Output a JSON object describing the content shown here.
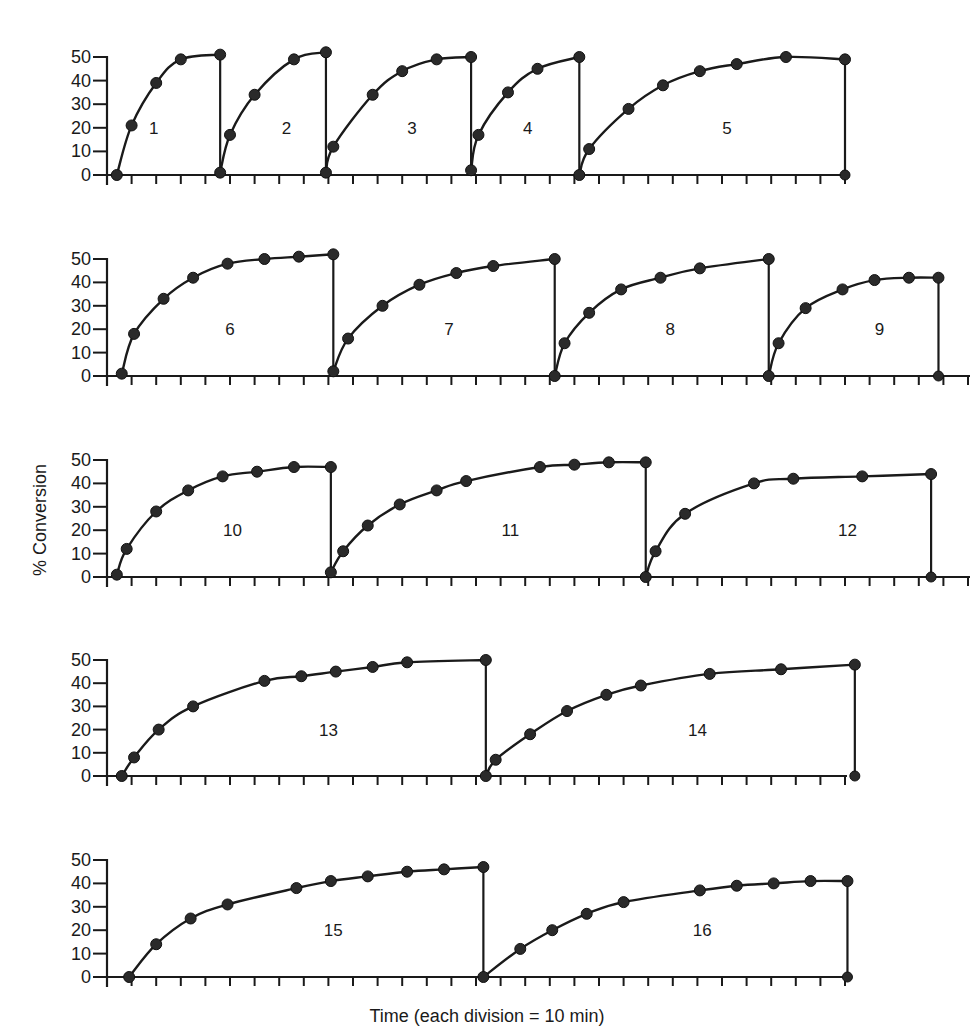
{
  "chart_data": {
    "type": "line",
    "title": "",
    "xlabel": "Time (each division = 10 min)",
    "ylabel": "% Conversion",
    "ylim": [
      0,
      50
    ],
    "yticks": [
      0,
      10,
      20,
      30,
      40,
      50
    ],
    "x_unit": "division (10 min)",
    "grid": false,
    "legend": null,
    "panels": [
      {
        "row": 1,
        "y0_px": 175,
        "y50_px": 57,
        "axis_x_px": 107,
        "tick_px": 24.6,
        "n_ticks": 30,
        "runs": [
          {
            "name": "1",
            "label_x": 1.9,
            "points": [
              [
                0.4,
                0
              ],
              [
                1.0,
                21
              ],
              [
                2.0,
                39
              ],
              [
                3.0,
                49
              ],
              [
                4.6,
                51
              ]
            ],
            "end_x": 4.6,
            "end_drop": true
          },
          {
            "name": "2",
            "label_x": 7.3,
            "points": [
              [
                4.6,
                1
              ],
              [
                5.0,
                17
              ],
              [
                6.0,
                34
              ],
              [
                7.6,
                49
              ],
              [
                8.9,
                52
              ]
            ],
            "end_x": 8.9,
            "end_drop": true
          },
          {
            "name": "3",
            "label_x": 12.4,
            "points": [
              [
                8.9,
                1
              ],
              [
                9.2,
                12
              ],
              [
                10.8,
                34
              ],
              [
                12.0,
                44
              ],
              [
                13.4,
                49
              ],
              [
                14.8,
                50
              ]
            ],
            "end_x": 14.8,
            "end_drop": true
          },
          {
            "name": "4",
            "label_x": 17.1,
            "points": [
              [
                14.8,
                2
              ],
              [
                15.1,
                17
              ],
              [
                16.3,
                35
              ],
              [
                17.5,
                45
              ],
              [
                19.2,
                50
              ]
            ],
            "end_x": 19.2,
            "end_drop": true
          },
          {
            "name": "5",
            "label_x": 25.2,
            "points": [
              [
                19.2,
                0
              ],
              [
                19.6,
                11
              ],
              [
                21.2,
                28
              ],
              [
                22.6,
                38
              ],
              [
                24.1,
                44
              ],
              [
                25.6,
                47
              ],
              [
                27.6,
                50
              ],
              [
                30.0,
                49
              ]
            ],
            "end_x": 30.0,
            "end_drop": true,
            "end_bottom_dot": true
          }
        ]
      },
      {
        "row": 2,
        "y0_px": 376,
        "y50_px": 259,
        "axis_x_px": 107,
        "tick_px": 24.6,
        "n_ticks": 35,
        "runs": [
          {
            "name": "6",
            "label_x": 5.0,
            "points": [
              [
                0.6,
                1
              ],
              [
                1.1,
                18
              ],
              [
                2.3,
                33
              ],
              [
                3.5,
                42
              ],
              [
                4.9,
                48
              ],
              [
                6.4,
                50
              ],
              [
                7.8,
                51
              ],
              [
                9.2,
                52
              ]
            ],
            "end_x": 9.2,
            "end_drop": true
          },
          {
            "name": "7",
            "label_x": 13.9,
            "points": [
              [
                9.2,
                2
              ],
              [
                9.8,
                16
              ],
              [
                11.2,
                30
              ],
              [
                12.7,
                39
              ],
              [
                14.2,
                44
              ],
              [
                15.7,
                47
              ],
              [
                18.2,
                50
              ]
            ],
            "end_x": 18.2,
            "end_drop": true
          },
          {
            "name": "8",
            "label_x": 22.9,
            "points": [
              [
                18.2,
                0
              ],
              [
                18.6,
                14
              ],
              [
                19.6,
                27
              ],
              [
                20.9,
                37
              ],
              [
                22.5,
                42
              ],
              [
                24.1,
                46
              ],
              [
                26.9,
                50
              ]
            ],
            "end_x": 26.9,
            "end_drop": true
          },
          {
            "name": "9",
            "label_x": 31.4,
            "points": [
              [
                26.9,
                0
              ],
              [
                27.3,
                14
              ],
              [
                28.4,
                29
              ],
              [
                29.9,
                37
              ],
              [
                31.2,
                41
              ],
              [
                32.6,
                42
              ],
              [
                33.8,
                42
              ]
            ],
            "end_x": 33.8,
            "end_drop": true,
            "end_bottom_dot": true
          }
        ]
      },
      {
        "row": 3,
        "y0_px": 577,
        "y50_px": 460,
        "axis_x_px": 107,
        "tick_px": 24.6,
        "n_ticks": 35,
        "runs": [
          {
            "name": "10",
            "label_x": 5.1,
            "points": [
              [
                0.4,
                1
              ],
              [
                0.8,
                12
              ],
              [
                2.0,
                28
              ],
              [
                3.3,
                37
              ],
              [
                4.7,
                43
              ],
              [
                6.1,
                45
              ],
              [
                7.6,
                47
              ],
              [
                9.1,
                47
              ]
            ],
            "end_x": 9.1,
            "end_drop": true
          },
          {
            "name": "11",
            "label_x": 16.4,
            "points": [
              [
                9.1,
                2
              ],
              [
                9.6,
                11
              ],
              [
                10.6,
                22
              ],
              [
                11.9,
                31
              ],
              [
                13.4,
                37
              ],
              [
                14.6,
                41
              ],
              [
                17.6,
                47
              ],
              [
                19.0,
                48
              ],
              [
                20.4,
                49
              ],
              [
                21.9,
                49
              ]
            ],
            "end_x": 21.9,
            "end_drop": true
          },
          {
            "name": "12",
            "label_x": 30.1,
            "points": [
              [
                21.9,
                0
              ],
              [
                22.3,
                11
              ],
              [
                23.5,
                27
              ],
              [
                26.3,
                40
              ],
              [
                27.9,
                42
              ],
              [
                30.7,
                43
              ],
              [
                33.5,
                44
              ]
            ],
            "end_x": 33.5,
            "end_drop": true,
            "end_bottom_dot": true
          }
        ]
      },
      {
        "row": 4,
        "y0_px": 776,
        "y50_px": 660,
        "axis_x_px": 107,
        "tick_px": 24.6,
        "n_ticks": 30,
        "runs": [
          {
            "name": "13",
            "label_x": 9.0,
            "points": [
              [
                0.6,
                0
              ],
              [
                1.1,
                8
              ],
              [
                2.1,
                20
              ],
              [
                3.5,
                30
              ],
              [
                6.4,
                41
              ],
              [
                7.9,
                43
              ],
              [
                9.3,
                45
              ],
              [
                10.8,
                47
              ],
              [
                12.2,
                49
              ],
              [
                15.4,
                50
              ]
            ],
            "end_x": 15.4,
            "end_drop": true
          },
          {
            "name": "14",
            "label_x": 24.0,
            "points": [
              [
                15.4,
                0
              ],
              [
                15.8,
                7
              ],
              [
                17.2,
                18
              ],
              [
                18.7,
                28
              ],
              [
                20.3,
                35
              ],
              [
                21.7,
                39
              ],
              [
                24.5,
                44
              ],
              [
                27.4,
                46
              ],
              [
                30.4,
                48
              ]
            ],
            "end_x": 30.4,
            "end_drop": true,
            "end_bottom_dot": true
          }
        ]
      },
      {
        "row": 5,
        "y0_px": 977,
        "y50_px": 860,
        "axis_x_px": 107,
        "tick_px": 24.6,
        "n_ticks": 30,
        "runs": [
          {
            "name": "15",
            "label_x": 9.2,
            "points": [
              [
                0.9,
                0
              ],
              [
                2.0,
                14
              ],
              [
                3.4,
                25
              ],
              [
                4.9,
                31
              ],
              [
                7.7,
                38
              ],
              [
                9.1,
                41
              ],
              [
                10.6,
                43
              ],
              [
                12.2,
                45
              ],
              [
                13.7,
                46
              ],
              [
                15.3,
                47
              ]
            ],
            "end_x": 15.3,
            "end_drop": true
          },
          {
            "name": "16",
            "label_x": 24.2,
            "points": [
              [
                15.3,
                0
              ],
              [
                16.8,
                12
              ],
              [
                18.1,
                20
              ],
              [
                19.5,
                27
              ],
              [
                21.0,
                32
              ],
              [
                24.1,
                37
              ],
              [
                25.6,
                39
              ],
              [
                27.1,
                40
              ],
              [
                28.6,
                41
              ],
              [
                30.1,
                41
              ]
            ],
            "end_x": 30.1,
            "end_drop": true,
            "end_bottom_dot": true
          }
        ]
      }
    ]
  },
  "labels": {
    "ylabel": "% Conversion",
    "xlabel": "Time (each division = 10 min)"
  }
}
